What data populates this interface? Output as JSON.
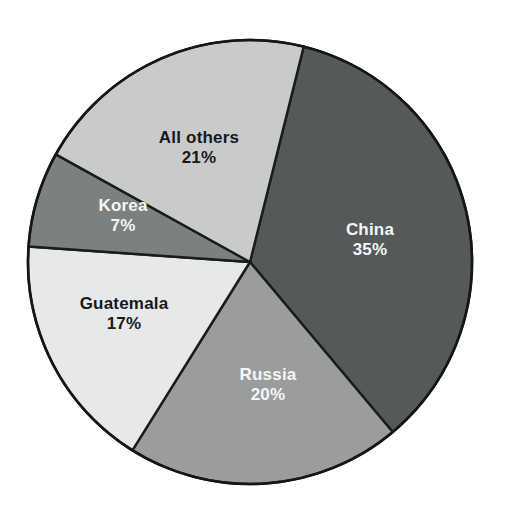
{
  "chart_data": {
    "type": "pie",
    "title": "",
    "subtitle": "",
    "xlabel": "",
    "ylabel": "",
    "legend_position": "none",
    "grid": false,
    "labels_inside_slices": true,
    "total": 100,
    "units": "percent",
    "categories": [
      "China",
      "Russia",
      "Guatemala",
      "Korea",
      "All others"
    ],
    "values": [
      35,
      20,
      17,
      7,
      21
    ],
    "value_labels": [
      "35%",
      "20%",
      "17%",
      "7%",
      "21%"
    ],
    "start_angle_deg": 14,
    "direction": "clockwise",
    "slices": [
      {
        "name": "China",
        "value": 35,
        "value_label": "35%",
        "color": "#55595a",
        "text_color": "#f4f6f5",
        "start_deg": 14,
        "end_deg": 140,
        "label_x": 370,
        "label_y": 240
      },
      {
        "name": "Russia",
        "value": 20,
        "value_label": "20%",
        "color": "#9a9d9c",
        "text_color": "#f4f6f5",
        "start_deg": 140,
        "end_deg": 212,
        "label_x": 268,
        "label_y": 385
      },
      {
        "name": "Guatemala",
        "value": 17,
        "value_label": "17%",
        "color": "#e7e9e8",
        "text_color": "#17191a",
        "start_deg": 212,
        "end_deg": 274,
        "label_x": 124,
        "label_y": 314
      },
      {
        "name": "Korea",
        "value": 7,
        "value_label": "7%",
        "color": "#7c817f",
        "text_color": "#f4f6f5",
        "start_deg": 274,
        "end_deg": 299,
        "label_x": 123,
        "label_y": 216
      },
      {
        "name": "All others",
        "value": 21,
        "value_label": "21%",
        "color": "#c9cbca",
        "text_color": "#17191a",
        "start_deg": 299,
        "end_deg": 374,
        "label_x": 199,
        "label_y": 148
      }
    ],
    "geometry": {
      "center_x": 250,
      "center_y": 262,
      "radius": 222
    },
    "style": {
      "background": "#ffffff",
      "outline_color": "#151716"
    }
  }
}
